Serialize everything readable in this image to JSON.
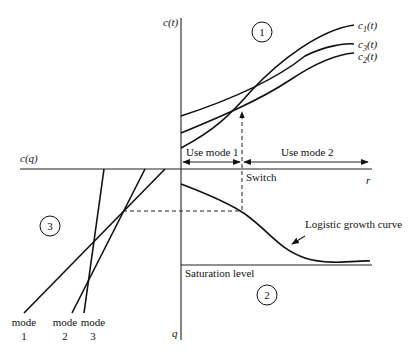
{
  "axes": {
    "c_t": "c(t)",
    "c_q": "c(q)",
    "r": "r",
    "q": "q"
  },
  "quadrants": {
    "q1": "1",
    "q2": "2",
    "q3": "3"
  },
  "curves": {
    "c1": {
      "base": "c",
      "sub": "1",
      "tail": "(t)"
    },
    "c2": {
      "base": "c",
      "sub": "2",
      "tail": "(t)"
    },
    "c3": {
      "base": "c",
      "sub": "3",
      "tail": "(t)"
    }
  },
  "annotations": {
    "use_mode_1": "Use mode 1",
    "use_mode_2": "Use mode 2",
    "switch": "Switch",
    "logistic": "Logistic growth curve",
    "saturation": "Saturation level"
  },
  "modes": [
    {
      "word": "mode",
      "num": "1"
    },
    {
      "word": "mode",
      "num": "2"
    },
    {
      "word": "mode",
      "num": "3"
    }
  ]
}
